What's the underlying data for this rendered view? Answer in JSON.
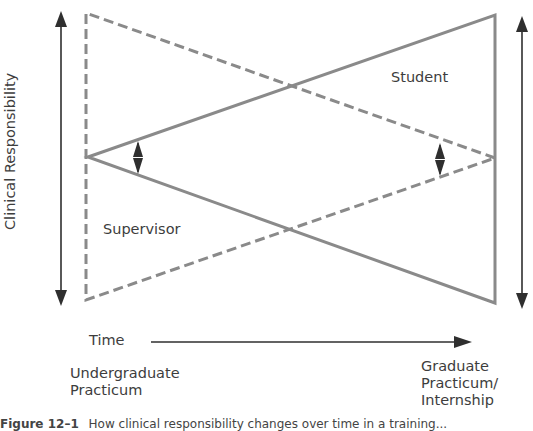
{
  "diagram": {
    "y_axis_label": "Clinical Responsibility",
    "x_axis_label": "Time",
    "start_label": "Undergraduate Practicum",
    "end_label": "Graduate Practicum/ Internship",
    "student_label": "Student",
    "supervisor_label": "Supervisor",
    "colors": {
      "student_line": "#8a8a8a",
      "supervisor_line": "#8a8a8a",
      "arrows": "#2f2f2f",
      "text": "#3d3d3d"
    },
    "series": [
      {
        "name": "Student",
        "style": "solid",
        "description": "Triangle widening from a point at left (low range) to full span at right",
        "points": [
          [
            88,
            157
          ],
          [
            495,
            15
          ],
          [
            495,
            303
          ]
        ]
      },
      {
        "name": "Supervisor",
        "style": "dashed",
        "description": "Triangle narrowing from full span at left to a point at right",
        "points": [
          [
            86,
            13
          ],
          [
            86,
            300
          ],
          [
            495,
            158
          ]
        ]
      }
    ]
  },
  "caption": {
    "number": "Figure 12–1",
    "text": "How clinical responsibility changes over time in a training..."
  }
}
